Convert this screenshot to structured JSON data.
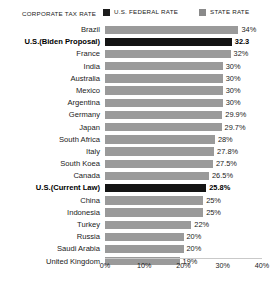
{
  "legend": {
    "title": "CORPORATE TAX RATE",
    "entries": [
      {
        "label": "U.S. FEDERAL RATE",
        "color": "#1c1c1c",
        "key": "federal"
      },
      {
        "label": "STATE RATE",
        "color": "#8a8a8a",
        "key": "state"
      }
    ]
  },
  "chart_data": {
    "type": "bar",
    "orientation": "horizontal",
    "title": "CORPORATE TAX RATE",
    "xlabel": "",
    "ylabel": "",
    "xlim": [
      0,
      40
    ],
    "grid": false,
    "legend_position": "top",
    "xticks": [
      "0%",
      "10%",
      "20%",
      "30%",
      "40%"
    ],
    "xtick_values": [
      0,
      10,
      20,
      30,
      40
    ],
    "categories": [
      "Brazil",
      "U.S.(Biden Proposal)",
      "France",
      "India",
      "Australia",
      "Mexico",
      "Argentina",
      "Germany",
      "Japan",
      "South Africa",
      "Italy",
      "South Koea",
      "Canada",
      "U.S.(Current Law)",
      "China",
      "Indonesia",
      "Turkey",
      "Russia",
      "Saudi Arabia",
      "United Kingdom"
    ],
    "values": [
      34,
      32.3,
      32,
      30,
      30,
      30,
      30,
      29.9,
      29.7,
      28,
      27.8,
      27.5,
      26.5,
      25.8,
      25,
      25,
      22,
      20,
      20,
      19
    ],
    "value_labels": [
      "34%",
      "32.3",
      "32%",
      "30%",
      "30%",
      "30%",
      "30%",
      "29.9%",
      "29.7%",
      "28%",
      "27.8%",
      "27.5%",
      "26.5%",
      "25.8%",
      "25%",
      "25%",
      "22%",
      "20%",
      "20%",
      "19%"
    ],
    "highlighted": [
      false,
      true,
      false,
      false,
      false,
      false,
      false,
      false,
      false,
      false,
      false,
      false,
      false,
      true,
      false,
      false,
      false,
      false,
      false,
      false
    ],
    "bar_color": "#9a9a9a",
    "highlight_color": "#141414"
  }
}
